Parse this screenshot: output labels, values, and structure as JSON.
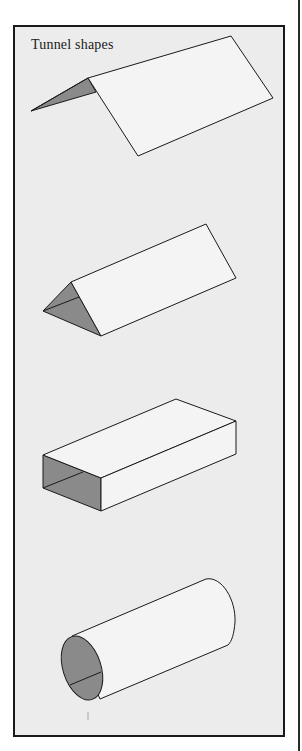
{
  "figure": {
    "title": "Tunnel shapes",
    "colors": {
      "panel_background": "#ececec",
      "face_fill": "#f4f4f4",
      "shaded_fill": "#8a8a8a",
      "stroke": "#1a1a1a"
    },
    "shapes": [
      {
        "name": "flat-ridge-shape",
        "label": "Tent / A-frame tunnel"
      },
      {
        "name": "triangular-prism",
        "label": "Triangular tunnel"
      },
      {
        "name": "rectangular-box",
        "label": "Rectangular tunnel"
      },
      {
        "name": "cylinder",
        "label": "Cylindrical tunnel"
      }
    ]
  }
}
